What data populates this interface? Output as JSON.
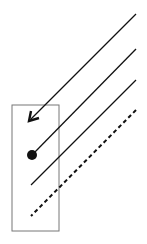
{
  "diagram": {
    "background": "#ffffff",
    "stroke_color": "#111111",
    "box_color": "#777777",
    "box": {
      "x": 12,
      "y": 105,
      "width": 47,
      "height": 126
    },
    "lines": [
      {
        "id": "arrow-line",
        "style": "solid",
        "x1": 136,
        "y1": 14,
        "x2": 31,
        "y2": 119,
        "end": "arrowhead"
      },
      {
        "id": "dot-line",
        "style": "solid",
        "x1": 136,
        "y1": 49,
        "x2": 33,
        "y2": 154,
        "end": "dot"
      },
      {
        "id": "plain-line",
        "style": "solid",
        "x1": 136,
        "y1": 80,
        "x2": 31,
        "y2": 185,
        "end": "none"
      },
      {
        "id": "dashed-line",
        "style": "dashed",
        "x1": 136,
        "y1": 110,
        "x2": 31,
        "y2": 216,
        "end": "none"
      }
    ],
    "dot": {
      "cx": 32,
      "cy": 155,
      "r": 5
    }
  }
}
